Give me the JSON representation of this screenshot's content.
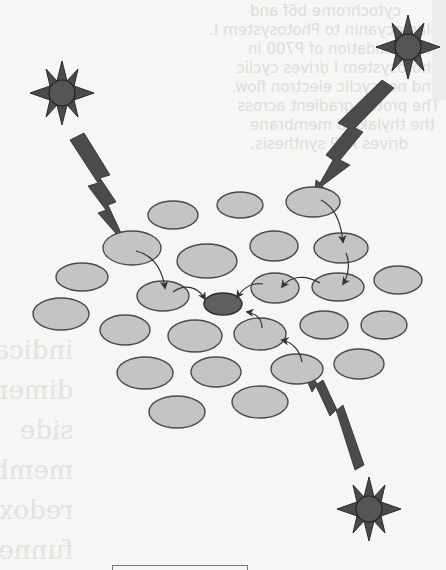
{
  "diagram": {
    "colors": {
      "pigment_fill": "#c4c4c2",
      "pigment_stroke": "#4a4a4a",
      "reaction_center_fill": "#5f5f5f",
      "sun_fill": "#4b4b4b",
      "bolt_fill": "#4b4b4b",
      "arrow": "#333333"
    },
    "suns": [
      {
        "id": "sun-top-left",
        "cx": 62,
        "cy": 93
      },
      {
        "id": "sun-top-right",
        "cx": 408,
        "cy": 47
      },
      {
        "id": "sun-bottom-right",
        "cx": 369,
        "cy": 509
      }
    ],
    "pigments": [
      {
        "cx": 173,
        "cy": 215,
        "rx": 25,
        "ry": 14
      },
      {
        "cx": 240,
        "cy": 205,
        "rx": 23,
        "ry": 13
      },
      {
        "cx": 313,
        "cy": 202,
        "rx": 27,
        "ry": 15
      },
      {
        "cx": 132,
        "cy": 248,
        "rx": 29,
        "ry": 17
      },
      {
        "cx": 207,
        "cy": 261,
        "rx": 30,
        "ry": 17
      },
      {
        "cx": 274,
        "cy": 246,
        "rx": 24,
        "ry": 15
      },
      {
        "cx": 341,
        "cy": 248,
        "rx": 27,
        "ry": 15
      },
      {
        "cx": 82,
        "cy": 277,
        "rx": 26,
        "ry": 14
      },
      {
        "cx": 163,
        "cy": 296,
        "rx": 26,
        "ry": 15
      },
      {
        "cx": 275,
        "cy": 288,
        "rx": 24,
        "ry": 15
      },
      {
        "cx": 338,
        "cy": 287,
        "rx": 26,
        "ry": 14
      },
      {
        "cx": 398,
        "cy": 280,
        "rx": 24,
        "ry": 14
      },
      {
        "cx": 61,
        "cy": 314,
        "rx": 28,
        "ry": 16
      },
      {
        "cx": 125,
        "cy": 330,
        "rx": 25,
        "ry": 15
      },
      {
        "cx": 195,
        "cy": 336,
        "rx": 27,
        "ry": 16
      },
      {
        "cx": 260,
        "cy": 334,
        "rx": 26,
        "ry": 16
      },
      {
        "cx": 324,
        "cy": 325,
        "rx": 24,
        "ry": 14
      },
      {
        "cx": 384,
        "cy": 325,
        "rx": 23,
        "ry": 14
      },
      {
        "cx": 145,
        "cy": 373,
        "rx": 28,
        "ry": 16
      },
      {
        "cx": 216,
        "cy": 372,
        "rx": 25,
        "ry": 15
      },
      {
        "cx": 297,
        "cy": 369,
        "rx": 26,
        "ry": 15
      },
      {
        "cx": 359,
        "cy": 364,
        "rx": 25,
        "ry": 15
      },
      {
        "cx": 177,
        "cy": 412,
        "rx": 28,
        "ry": 16
      },
      {
        "cx": 260,
        "cy": 402,
        "rx": 28,
        "ry": 16
      }
    ],
    "reaction_center": {
      "cx": 223,
      "cy": 304,
      "rx": 19,
      "ry": 11
    },
    "bleed_through_text_right": [
      "cytochrome b6f and",
      "plastocyanin to Photosystem I.",
      "Photooxidation of P700 in",
      "Photosystem I drives cyclic",
      "and noncyclic electron flow.",
      "The proton gradient across",
      "the thylakoid membrane",
      "drives ATP synthesis."
    ],
    "bleed_through_text_left": [
      "indica",
      "dimer",
      "side",
      "memb",
      "redox",
      "funnel"
    ],
    "bleed_through_text_far_right": [
      "by ki",
      "these",
      "in a se"
    ]
  }
}
